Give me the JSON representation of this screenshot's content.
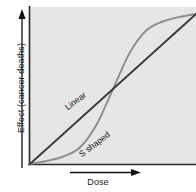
{
  "figure": {
    "title": "",
    "background_color": "#ffffff",
    "plot_background_color": "#e8e8e8"
  },
  "axes": {
    "y_label": "Effect (cancer deaths)",
    "x_label": "Dose",
    "y_arrow_name": "y-axis-arrow",
    "x_arrow_name": "x-axis-arrow"
  },
  "labels": {
    "linear": "Linear",
    "s_shaped": "S shaped"
  },
  "chart_data": {
    "type": "line",
    "title": "",
    "xlabel": "Dose",
    "ylabel": "Effect (cancer deaths)",
    "xlim": [
      0,
      1
    ],
    "ylim": [
      0,
      1
    ],
    "grid": false,
    "legend": "inline-curve-labels",
    "axis_ticks": false,
    "annotations": [
      {
        "text": "Linear",
        "x": 0.27,
        "y": 0.33,
        "rotation": -37
      },
      {
        "text": "S shaped",
        "x": 0.36,
        "y": 0.1,
        "rotation": -37
      }
    ],
    "series": [
      {
        "name": "Linear",
        "color": "#3a3a3a",
        "width": 1.9,
        "x": [
          0.0,
          0.1,
          0.2,
          0.3,
          0.4,
          0.5,
          0.6,
          0.7,
          0.8,
          0.9,
          1.0
        ],
        "values": [
          0.0,
          0.1,
          0.2,
          0.3,
          0.4,
          0.5,
          0.6,
          0.7,
          0.8,
          0.9,
          1.0
        ]
      },
      {
        "name": "S shaped",
        "color": "#8d8d8d",
        "width": 1.9,
        "x": [
          0.0,
          0.1,
          0.2,
          0.3,
          0.4,
          0.5,
          0.6,
          0.7,
          0.8,
          0.9,
          1.0
        ],
        "values": [
          0.0,
          0.02,
          0.05,
          0.11,
          0.26,
          0.5,
          0.74,
          0.89,
          0.95,
          0.98,
          1.0
        ]
      }
    ],
    "intersection": {
      "x": 0.5,
      "y": 0.5
    }
  }
}
